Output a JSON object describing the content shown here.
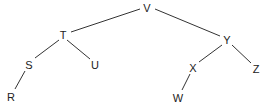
{
  "diagram": {
    "type": "tree",
    "colors": {
      "edge": "#333333",
      "label": "#222222",
      "background": "#ffffff"
    },
    "nodes": [
      {
        "id": "V",
        "label": "V",
        "x": 147,
        "y": 8
      },
      {
        "id": "T",
        "label": "T",
        "x": 63,
        "y": 35
      },
      {
        "id": "Y",
        "label": "Y",
        "x": 227,
        "y": 40
      },
      {
        "id": "S",
        "label": "S",
        "x": 29,
        "y": 65
      },
      {
        "id": "U",
        "label": "U",
        "x": 95,
        "y": 65
      },
      {
        "id": "X",
        "label": "X",
        "x": 193,
        "y": 68
      },
      {
        "id": "Z",
        "label": "Z",
        "x": 256,
        "y": 69
      },
      {
        "id": "R",
        "label": "R",
        "x": 11,
        "y": 97
      },
      {
        "id": "W",
        "label": "W",
        "x": 178,
        "y": 98
      }
    ],
    "edges": [
      {
        "from": "V",
        "to": "T",
        "x1": 140,
        "y1": 9,
        "x2": 71,
        "y2": 32
      },
      {
        "from": "V",
        "to": "Y",
        "x1": 155,
        "y1": 9,
        "x2": 220,
        "y2": 36
      },
      {
        "from": "T",
        "to": "S",
        "x1": 59,
        "y1": 40,
        "x2": 35,
        "y2": 58
      },
      {
        "from": "T",
        "to": "U",
        "x1": 67,
        "y1": 40,
        "x2": 90,
        "y2": 59
      },
      {
        "from": "S",
        "to": "R",
        "x1": 25,
        "y1": 71,
        "x2": 15,
        "y2": 89
      },
      {
        "from": "Y",
        "to": "X",
        "x1": 222,
        "y1": 45,
        "x2": 199,
        "y2": 62
      },
      {
        "from": "Y",
        "to": "Z",
        "x1": 232,
        "y1": 45,
        "x2": 251,
        "y2": 63
      },
      {
        "from": "X",
        "to": "W",
        "x1": 190,
        "y1": 74,
        "x2": 182,
        "y2": 90
      }
    ]
  }
}
